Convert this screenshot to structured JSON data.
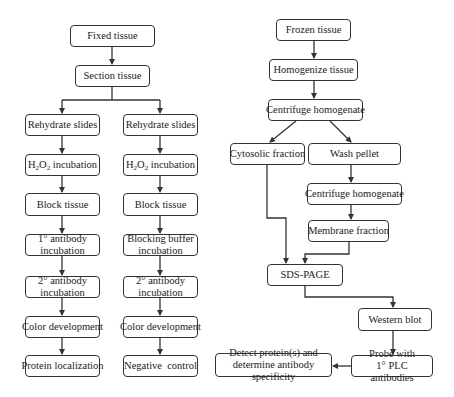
{
  "diagram": {
    "left_flow": {
      "root": [
        {
          "id": "fixed_tissue",
          "label": "Fixed tissue"
        },
        {
          "id": "section_tissue",
          "label": "Section tissue"
        }
      ],
      "branch_a": [
        {
          "id": "a_rehydrate",
          "label": "Rehydrate slides"
        },
        {
          "id": "a_h2o2",
          "label_pre": "H",
          "sub1": "2",
          "label_mid": "O",
          "sub2": "2",
          "label_post": " incubation"
        },
        {
          "id": "a_block",
          "label": "Block tissue"
        },
        {
          "id": "a_primary",
          "label": "1° antibody\nincubation"
        },
        {
          "id": "a_secondary",
          "label": "2° antibody\nincubation"
        },
        {
          "id": "a_color",
          "label": "Color development"
        },
        {
          "id": "a_result",
          "label": "Protein localization"
        }
      ],
      "branch_b": [
        {
          "id": "b_rehydrate",
          "label": "Rehydrate slides"
        },
        {
          "id": "b_h2o2",
          "label_pre": "H",
          "sub1": "2",
          "label_mid": "O",
          "sub2": "2",
          "label_post": " incubation"
        },
        {
          "id": "b_block",
          "label": "Block tissue"
        },
        {
          "id": "b_buffer",
          "label": "Blocking buffer\nincubation"
        },
        {
          "id": "b_secondary",
          "label": "2° antibody\nincubation"
        },
        {
          "id": "b_color",
          "label": "Color development"
        },
        {
          "id": "b_result",
          "label": "Negative  control"
        }
      ]
    },
    "right_flow": {
      "frozen_tissue": "Frozen tissue",
      "homogenize_tissue": "Homogenize tissue",
      "centrifuge_1": "Centrifuge homogenate",
      "cytosolic_fraction": "Cytosolic fraction",
      "wash_pellet": "Wash pellet",
      "centrifuge_2": "Centrifuge homogenate",
      "membrane_fraction": "Membrane fraction",
      "sds_page": "SDS-PAGE",
      "western_blot": "Western blot",
      "probe": "Probe with\n1° PLC antibodies",
      "detect": "Detect protein(s) and\ndetermine antibody specificity"
    },
    "colors": {
      "line": "#333333",
      "box_fill": "#ffffff",
      "text": "#222222"
    }
  }
}
